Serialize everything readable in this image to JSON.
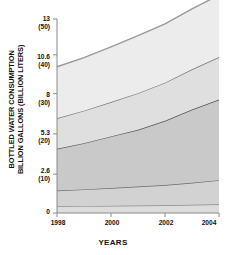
{
  "chart_data": {
    "type": "area",
    "title": "",
    "xlabel": "YEARS",
    "ylabel": "BOTTLED WATER CONSUMPTION BILLION GALLONS (BILLION LITERS)",
    "ylabel_line1": "BOTTLED WATER CONSUMPTION",
    "ylabel_line2": "BILLION GALLONS (BILLION LITERS)",
    "x": [
      1998,
      1999,
      2000,
      2001,
      2002,
      2003,
      2004
    ],
    "xticks": [
      "1998",
      "2000",
      "2002",
      "2004"
    ],
    "xtick_values": [
      1998,
      2000,
      2002,
      2004
    ],
    "ylim": [
      0,
      13
    ],
    "yticks_gallons": [
      "0",
      "2.6",
      "5.3",
      "8",
      "10.6",
      "13"
    ],
    "yticks_liters": [
      "",
      "(10)",
      "(20)",
      "(30)",
      "(40)",
      "(50)"
    ],
    "ytick_values": [
      0,
      2.6,
      5.3,
      8,
      10.6,
      13
    ],
    "grid": false,
    "legend": "none",
    "stacked": true,
    "series": [
      {
        "name": "band-1",
        "values": [
          0.45,
          0.46,
          0.48,
          0.5,
          0.52,
          0.55,
          0.58
        ],
        "fill": "#dcdcdc",
        "line": "#8c8c8c"
      },
      {
        "name": "band-2",
        "values": [
          1.05,
          1.12,
          1.2,
          1.28,
          1.36,
          1.48,
          1.62
        ],
        "fill": "#d2d2d2",
        "line": "#6b6b6b"
      },
      {
        "name": "band-3",
        "values": [
          2.8,
          3.1,
          3.45,
          3.8,
          4.3,
          4.9,
          5.4
        ],
        "fill": "#c9c9c9",
        "line": "#555555"
      },
      {
        "name": "band-4",
        "values": [
          2.05,
          2.18,
          2.3,
          2.45,
          2.55,
          2.7,
          2.85
        ],
        "fill": "#dfdfdf",
        "line": "#777777"
      },
      {
        "name": "band-5",
        "values": [
          3.45,
          3.55,
          3.7,
          3.85,
          3.95,
          4.05,
          4.15
        ],
        "fill": "#ececec",
        "line": "#9a9a9a"
      }
    ],
    "totals": [
      9.8,
      10.41,
      11.13,
      11.88,
      12.68,
      13.68,
      14.6
    ],
    "colors": {
      "axis": "#8a8a8a",
      "text": "#111111",
      "background": "#ffffff"
    }
  }
}
